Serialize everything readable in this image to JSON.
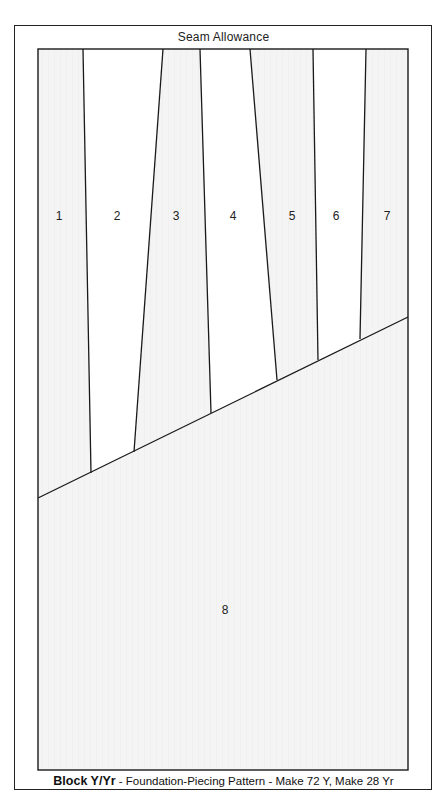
{
  "header": {
    "seam_label": "Seam Allowance"
  },
  "footer": {
    "block_name": "Block Y/Yr",
    "description": " - Foundation-Piecing Pattern - Make 72 Y, Make 28 Yr"
  },
  "colors": {
    "line": "#1a1a1a",
    "shaded_fill": "#f4f4f4",
    "unshaded_fill": "#ffffff"
  },
  "pieces": [
    {
      "number": "1",
      "shaded": true
    },
    {
      "number": "2",
      "shaded": false
    },
    {
      "number": "3",
      "shaded": true
    },
    {
      "number": "4",
      "shaded": false
    },
    {
      "number": "5",
      "shaded": true
    },
    {
      "number": "6",
      "shaded": false
    },
    {
      "number": "7",
      "shaded": true
    },
    {
      "number": "8",
      "shaded": true
    }
  ]
}
